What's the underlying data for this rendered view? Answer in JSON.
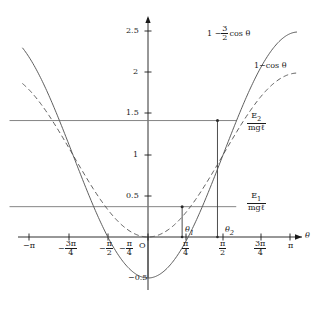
{
  "figure": {
    "kind": "pendulum-energy-diagram",
    "background": "#ffffff",
    "axis_color": "#1a1a1a",
    "curve_color": "#555555",
    "level_color": "#777777"
  },
  "axes": {
    "xlabel": "θ",
    "origin_label": "O",
    "xticks": [
      {
        "value": -3.14159,
        "label_num": "−π",
        "label_den": "",
        "fraction": false
      },
      {
        "value": -2.35619,
        "label_num": "3π",
        "label_den": "4",
        "fraction": true,
        "sign": "−"
      },
      {
        "value": -1.5708,
        "label_num": "π",
        "label_den": "2",
        "fraction": true,
        "sign": "−"
      },
      {
        "value": -0.7854,
        "label_num": "π",
        "label_den": "4",
        "fraction": true,
        "sign": "−"
      },
      {
        "value": 0.7854,
        "label_num": "π",
        "label_den": "4",
        "fraction": true,
        "sign": ""
      },
      {
        "value": 1.5708,
        "label_num": "π",
        "label_den": "2",
        "fraction": true,
        "sign": ""
      },
      {
        "value": 2.35619,
        "label_num": "3π",
        "label_den": "4",
        "fraction": true,
        "sign": ""
      },
      {
        "value": 3.14159,
        "label_num": "π",
        "label_den": "",
        "fraction": false,
        "sign": ""
      }
    ],
    "yticks": [
      {
        "value": 2.5,
        "label": "2.5"
      },
      {
        "value": 2.0,
        "label": "2"
      },
      {
        "value": 1.5,
        "label": "1.5"
      },
      {
        "value": 1.0,
        "label": "1"
      },
      {
        "value": 0.5,
        "label": "0.5"
      },
      {
        "value": -0.5,
        "label": "−0.5"
      }
    ],
    "xlim": [
      -3.4,
      3.45
    ],
    "ylim": [
      -0.62,
      2.72
    ]
  },
  "curve_labels": {
    "solid_prefix": "1 −",
    "solid_frac_num": "3",
    "solid_frac_den": "2",
    "solid_suffix": "cos θ",
    "dashed": "1−cos θ"
  },
  "energy_levels": [
    {
      "id": "E2",
      "num": "E",
      "num_sub": "2",
      "den": "mg",
      "den_sym": "ℓ",
      "value": 1.42,
      "x_from": -2.9,
      "x_to": 1.45
    },
    {
      "id": "E1",
      "num": "E",
      "num_sub": "1",
      "den": "mg",
      "den_sym": "ℓ",
      "value": 0.37,
      "x_from": -2.9,
      "x_to": 1.45
    }
  ],
  "turning_points": [
    {
      "label": "θ",
      "sub": "1",
      "x": 0.715,
      "y": 0.37
    },
    {
      "label": "θ",
      "sub": "2",
      "x": 1.455,
      "y": 1.42
    }
  ],
  "chart_data": {
    "type": "line",
    "title": "",
    "xlabel": "θ",
    "ylabel": "",
    "xlim": [
      -3.4,
      3.45
    ],
    "ylim": [
      -0.62,
      2.72
    ],
    "grid": false,
    "legend": "inline-annotations",
    "series": [
      {
        "name": "1 - 3/2 cos θ",
        "style": "solid",
        "formula": "1 - 1.5*cos(theta)",
        "x": [
          -3.14159,
          -2.74889,
          -2.35619,
          -1.9635,
          -1.5708,
          -1.1781,
          -0.7854,
          -0.3927,
          0,
          0.3927,
          0.7854,
          1.1781,
          1.5708,
          1.9635,
          2.35619,
          2.74889,
          3.14159
        ],
        "y": [
          2.5,
          2.386,
          2.061,
          1.574,
          1.0,
          0.426,
          -0.061,
          -0.386,
          -0.5,
          -0.386,
          -0.061,
          0.426,
          1.0,
          1.574,
          2.061,
          2.386,
          2.5
        ]
      },
      {
        "name": "1 - cos θ",
        "style": "dashed",
        "formula": "1 - cos(theta)",
        "x": [
          -3.14159,
          -2.74889,
          -2.35619,
          -1.9635,
          -1.5708,
          -1.1781,
          -0.7854,
          -0.3927,
          0,
          0.3927,
          0.7854,
          1.1781,
          1.5708,
          1.9635,
          2.35619,
          2.74889,
          3.14159
        ],
        "y": [
          2.0,
          1.924,
          1.707,
          1.383,
          1.0,
          0.617,
          0.293,
          0.076,
          0,
          0.076,
          0.293,
          0.617,
          1.0,
          1.383,
          1.707,
          1.924,
          2.0
        ]
      }
    ],
    "horizontal_lines": [
      {
        "label": "E_2/(mgl)",
        "y": 1.42
      },
      {
        "label": "E_1/(mgl)",
        "y": 0.37
      }
    ],
    "annotations": [
      {
        "text": "θ₁",
        "x": 0.715,
        "y": 0.37,
        "note": "turning point of solid curve at E1 level"
      },
      {
        "text": "θ₂",
        "x": 1.455,
        "y": 1.42,
        "note": "turning point of solid curve at E2 level"
      }
    ]
  }
}
